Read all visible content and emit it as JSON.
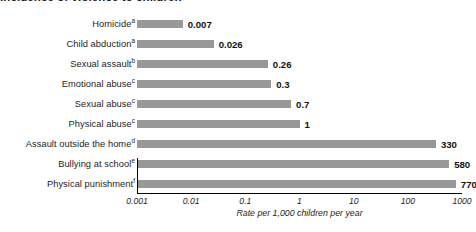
{
  "chart_data": {
    "type": "bar",
    "orientation": "horizontal",
    "title": "Incidence of violence to children",
    "xlabel": "Rate per 1,000 children per year",
    "ylabel": "",
    "xscale": "log",
    "xlim": [
      0.001,
      1000
    ],
    "xticks": [
      "0.001",
      "0.01",
      "0.1",
      "1",
      "10",
      "100",
      "1000"
    ],
    "xtick_values": [
      0.001,
      0.01,
      0.1,
      1,
      10,
      100,
      1000
    ],
    "grid": false,
    "legend": null,
    "bar_color": "#989898",
    "categories": [
      "Homicide",
      "Child abduction",
      "Sexual assault",
      "Emotional abuse",
      "Sexual abuse",
      "Physical abuse",
      "Assault outside the home",
      "Bullying at school",
      "Physical punishment"
    ],
    "footnote_markers": [
      "a",
      "a",
      "b",
      "c",
      "c",
      "c",
      "d",
      "e",
      "f"
    ],
    "values": [
      0.007,
      0.026,
      0.26,
      0.3,
      0.7,
      1,
      330,
      580,
      770
    ],
    "value_labels": [
      "0.007",
      "0.026",
      "0.26",
      "0.3",
      "0.7",
      "1",
      "330",
      "580",
      "770"
    ]
  }
}
